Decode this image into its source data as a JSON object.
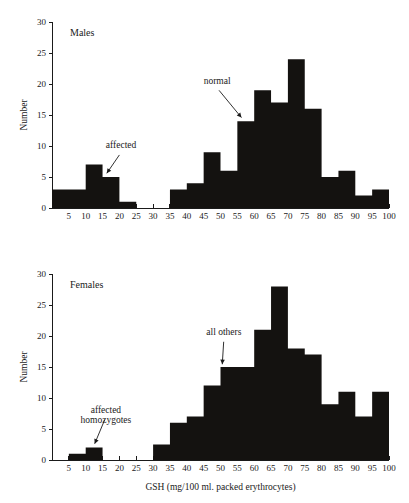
{
  "figure": {
    "xlabel": "GSH (mg/100 ml. packed erythrocytes)",
    "ylabel_males": "Number",
    "ylabel_females": "Number"
  },
  "chart_data": [
    {
      "type": "bar",
      "title": "Males",
      "xlabel": "",
      "ylabel": "Number",
      "xlim": [
        0,
        100
      ],
      "ylim": [
        0,
        30
      ],
      "xticks": [
        5,
        10,
        15,
        20,
        25,
        30,
        35,
        40,
        45,
        50,
        55,
        60,
        65,
        70,
        75,
        80,
        85,
        90,
        95,
        100
      ],
      "yticks": [
        0,
        5,
        10,
        15,
        20,
        25,
        30
      ],
      "grid": false,
      "legend": "none",
      "bin_width": 5,
      "bins": [
        {
          "start": 0,
          "end": 5,
          "value": 3
        },
        {
          "start": 5,
          "end": 10,
          "value": 3
        },
        {
          "start": 10,
          "end": 15,
          "value": 7
        },
        {
          "start": 15,
          "end": 20,
          "value": 5
        },
        {
          "start": 20,
          "end": 25,
          "value": 1
        },
        {
          "start": 25,
          "end": 30,
          "value": 0
        },
        {
          "start": 30,
          "end": 35,
          "value": 0
        },
        {
          "start": 35,
          "end": 40,
          "value": 3
        },
        {
          "start": 40,
          "end": 45,
          "value": 4
        },
        {
          "start": 45,
          "end": 50,
          "value": 9
        },
        {
          "start": 50,
          "end": 55,
          "value": 6
        },
        {
          "start": 55,
          "end": 60,
          "value": 14
        },
        {
          "start": 60,
          "end": 65,
          "value": 19
        },
        {
          "start": 65,
          "end": 70,
          "value": 17
        },
        {
          "start": 70,
          "end": 75,
          "value": 24
        },
        {
          "start": 75,
          "end": 80,
          "value": 16
        },
        {
          "start": 80,
          "end": 85,
          "value": 5
        },
        {
          "start": 85,
          "end": 90,
          "value": 6
        },
        {
          "start": 90,
          "end": 95,
          "value": 2
        },
        {
          "start": 95,
          "end": 100,
          "value": 3
        }
      ],
      "annotations": [
        {
          "text": "affected",
          "x": 20.5,
          "y": 9.6,
          "point_x": 16.0,
          "point_y": 5.4
        },
        {
          "text": "normal",
          "x": 49.0,
          "y": 20.0,
          "point_x": 56.5,
          "point_y": 14.4
        }
      ]
    },
    {
      "type": "bar",
      "title": "Females",
      "xlabel": "GSH (mg/100 ml. packed erythrocytes)",
      "ylabel": "Number",
      "xlim": [
        0,
        100
      ],
      "ylim": [
        0,
        30
      ],
      "xticks": [
        5,
        10,
        15,
        20,
        25,
        30,
        35,
        40,
        45,
        50,
        55,
        60,
        65,
        70,
        75,
        80,
        85,
        90,
        95,
        100
      ],
      "yticks": [
        0,
        5,
        10,
        15,
        20,
        25,
        30
      ],
      "grid": false,
      "legend": "none",
      "bin_width": 5,
      "bins": [
        {
          "start": 0,
          "end": 5,
          "value": 0
        },
        {
          "start": 5,
          "end": 10,
          "value": 1
        },
        {
          "start": 10,
          "end": 15,
          "value": 2
        },
        {
          "start": 15,
          "end": 20,
          "value": 0
        },
        {
          "start": 20,
          "end": 25,
          "value": 0
        },
        {
          "start": 25,
          "end": 30,
          "value": 0
        },
        {
          "start": 30,
          "end": 35,
          "value": 2.5
        },
        {
          "start": 35,
          "end": 40,
          "value": 6
        },
        {
          "start": 40,
          "end": 45,
          "value": 7
        },
        {
          "start": 45,
          "end": 50,
          "value": 12
        },
        {
          "start": 50,
          "end": 55,
          "value": 15
        },
        {
          "start": 55,
          "end": 60,
          "value": 15
        },
        {
          "start": 60,
          "end": 65,
          "value": 21
        },
        {
          "start": 65,
          "end": 70,
          "value": 28
        },
        {
          "start": 70,
          "end": 75,
          "value": 18
        },
        {
          "start": 75,
          "end": 80,
          "value": 17
        },
        {
          "start": 80,
          "end": 85,
          "value": 9
        },
        {
          "start": 85,
          "end": 90,
          "value": 11
        },
        {
          "start": 90,
          "end": 95,
          "value": 7
        },
        {
          "start": 95,
          "end": 100,
          "value": 11
        }
      ],
      "annotations": [
        {
          "text": "all others",
          "x": 51.0,
          "y": 20.2,
          "point_x": 50.5,
          "point_y": 15.2
        },
        {
          "text": "affected",
          "x": 16.0,
          "y": 7.6,
          "point_x": 12.5,
          "point_y": 2.4
        },
        {
          "text": "homozygotes",
          "x": 16.0,
          "y": 5.9,
          "point_x": null,
          "point_y": null
        }
      ]
    }
  ]
}
